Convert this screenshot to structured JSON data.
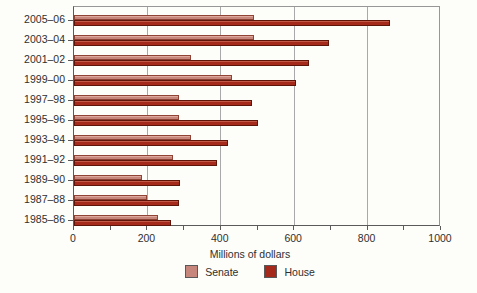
{
  "figure": {
    "background": "#fdfdfa"
  },
  "chart_data": {
    "type": "bar",
    "orientation": "horizontal",
    "title": "",
    "xlabel": "Millions of dollars",
    "ylabel": "",
    "xlim": [
      0,
      1000
    ],
    "xticks": [
      0,
      200,
      400,
      600,
      800,
      1000
    ],
    "minor_tick_interval": 100,
    "gridline_values": [
      200,
      400,
      600,
      800
    ],
    "grid": "vertical-on",
    "legend_position": "bottom",
    "categories": [
      "2005–06",
      "2003–04",
      "2001–02",
      "1999–00",
      "1997–98",
      "1995–96",
      "1993–94",
      "1991–92",
      "1989–90",
      "1987–88",
      "1985–86"
    ],
    "series": [
      {
        "name": "Senate",
        "color": "#c6867b",
        "highlight": "#e0a99e",
        "border": "#8e4335",
        "values": [
          490,
          490,
          320,
          430,
          285,
          285,
          320,
          270,
          185,
          200,
          230
        ]
      },
      {
        "name": "House",
        "color": "#a52a1b",
        "highlight": "#c25947",
        "border": "#5f150a",
        "values": [
          860,
          695,
          640,
          605,
          485,
          500,
          420,
          390,
          290,
          285,
          265
        ]
      }
    ]
  }
}
